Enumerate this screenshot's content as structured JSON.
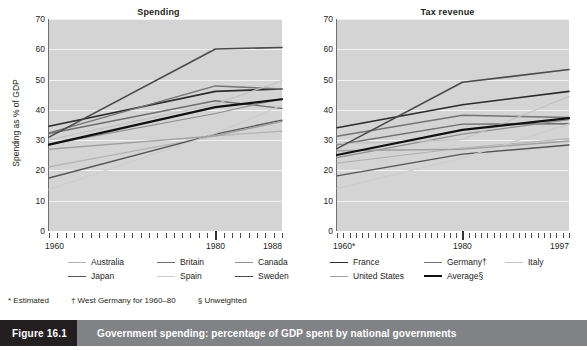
{
  "figure": {
    "number_label": "Figure 16.1",
    "caption": "Government spending: percentage of GDP spent by national governments"
  },
  "footnotes": [
    "* Estimated",
    "† West Germany for 1960–80",
    "§ Unweighted"
  ],
  "legend": {
    "row1": [
      {
        "label": "Australia",
        "color": "#b3b3b3",
        "width": 1.2
      },
      {
        "label": "Britain",
        "color": "#6d6d6d",
        "width": 1.4
      },
      {
        "label": "Canada",
        "color": "#8f8f8f",
        "width": 1.2
      },
      {
        "label": "France",
        "color": "#2b2b2b",
        "width": 1.6
      },
      {
        "label": "Germany†",
        "color": "#747474",
        "width": 1.4
      },
      {
        "label": "Italy",
        "color": "#c2c2c2",
        "width": 1.2
      }
    ],
    "row2": [
      {
        "label": "Japan",
        "color": "#555555",
        "width": 1.4
      },
      {
        "label": "Spain",
        "color": "#cccccc",
        "width": 1.2
      },
      {
        "label": "Sweden",
        "color": "#4a4a4a",
        "width": 1.6
      },
      {
        "label": "United States",
        "color": "#a0a0a0",
        "width": 1.4
      },
      {
        "label": "Average§",
        "color": "#111111",
        "width": 2.2
      }
    ]
  },
  "chart_data": [
    {
      "type": "line",
      "title": "Spending",
      "xlabel": "",
      "ylabel": "Spending as % of GDP",
      "ylim": [
        0,
        70
      ],
      "yticks": [
        0,
        10,
        20,
        30,
        40,
        50,
        60,
        70
      ],
      "xlim": [
        1960,
        1988
      ],
      "xticks": [
        1960,
        1980,
        1988
      ],
      "xtick_labels": [
        "1960",
        "1980",
        "1988"
      ],
      "grid": "horizontal",
      "legend_position": "below-figure",
      "x": [
        1960,
        1980,
        1988
      ],
      "series": [
        {
          "name": "Australia",
          "values": [
            21.2,
            31.4,
            33.0
          ]
        },
        {
          "name": "Britain",
          "values": [
            32.2,
            43.0,
            40.5
          ]
        },
        {
          "name": "Canada",
          "values": [
            28.6,
            38.8,
            43.7
          ]
        },
        {
          "name": "France",
          "values": [
            34.6,
            46.1,
            46.9
          ]
        },
        {
          "name": "Germany†",
          "values": [
            32.4,
            47.9,
            46.9
          ]
        },
        {
          "name": "Italy",
          "values": [
            30.1,
            41.9,
            49.6
          ]
        },
        {
          "name": "Japan",
          "values": [
            17.5,
            32.0,
            36.6
          ]
        },
        {
          "name": "Spain",
          "values": [
            13.7,
            32.2,
            41.6
          ]
        },
        {
          "name": "Sweden",
          "values": [
            31.0,
            60.1,
            60.6
          ]
        },
        {
          "name": "United States",
          "values": [
            27.0,
            31.4,
            36.2
          ]
        },
        {
          "name": "Average§",
          "values": [
            28.5,
            40.9,
            43.5
          ]
        }
      ]
    },
    {
      "type": "line",
      "title": "Tax revenue",
      "xlabel": "",
      "ylabel": "",
      "ylim": [
        0,
        70
      ],
      "yticks": [
        0,
        10,
        20,
        30,
        40,
        50,
        60,
        70
      ],
      "xlim": [
        1960,
        1997
      ],
      "xticks": [
        1960,
        1980,
        1997
      ],
      "xtick_labels": [
        "1960*",
        "1980",
        "1997"
      ],
      "grid": "horizontal",
      "legend_position": "below-figure",
      "x": [
        1960,
        1980,
        1997
      ],
      "series": [
        {
          "name": "Australia",
          "values": [
            22.4,
            27.4,
            30.5
          ]
        },
        {
          "name": "Britain",
          "values": [
            28.5,
            35.3,
            35.4
          ]
        },
        {
          "name": "Canada",
          "values": [
            24.2,
            32.0,
            36.8
          ]
        },
        {
          "name": "France",
          "values": [
            34.1,
            41.7,
            46.1
          ]
        },
        {
          "name": "Germany†",
          "values": [
            31.3,
            38.2,
            37.5
          ]
        },
        {
          "name": "Italy",
          "values": [
            28.8,
            30.2,
            44.4
          ]
        },
        {
          "name": "Japan",
          "values": [
            18.2,
            25.4,
            28.4
          ]
        },
        {
          "name": "Spain",
          "values": [
            14.1,
            24.1,
            35.3
          ]
        },
        {
          "name": "Sweden",
          "values": [
            27.2,
            49.1,
            53.3
          ]
        },
        {
          "name": "United States",
          "values": [
            26.5,
            27.0,
            29.7
          ]
        },
        {
          "name": "Average§",
          "values": [
            25.1,
            33.4,
            37.3
          ]
        }
      ]
    }
  ]
}
